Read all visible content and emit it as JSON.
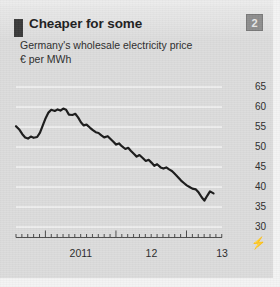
{
  "card": {
    "background_color": "#dcdcdc",
    "accent_bar_color": "#3a3a3a"
  },
  "header": {
    "title": "Cheaper for some",
    "subtitle_line1": "Germany's wholesale electricity price",
    "subtitle_line2": "€ per MWh"
  },
  "badge": {
    "label": "2",
    "color": "#8e8e8e"
  },
  "axis_break_symbol": "⚡",
  "chart_data": {
    "type": "line",
    "title": "Cheaper for some",
    "subtitle": "Germany's wholesale electricity price",
    "xlabel": "",
    "ylabel": "€ per MWh",
    "ylim": [
      30,
      65
    ],
    "yticks": [
      30,
      35,
      40,
      45,
      50,
      55,
      60,
      65
    ],
    "ytick_labels": [
      "30",
      "35",
      "40",
      "45",
      "50",
      "55",
      "60",
      "65"
    ],
    "xticks": [
      2011,
      2012,
      2013
    ],
    "xtick_labels": [
      "2011",
      "12",
      "13"
    ],
    "xlim": [
      2010.58,
      2013.5
    ],
    "grid": true,
    "grid_color": "#f5f5f5",
    "legend": false,
    "line_color": "#1a1a1a",
    "series": [
      {
        "name": "German wholesale electricity price",
        "x": [
          2010.58,
          2010.63,
          2010.67,
          2010.71,
          2010.75,
          2010.79,
          2010.83,
          2010.88,
          2010.92,
          2010.96,
          2011.0,
          2011.04,
          2011.08,
          2011.13,
          2011.17,
          2011.21,
          2011.25,
          2011.29,
          2011.33,
          2011.38,
          2011.42,
          2011.46,
          2011.5,
          2011.54,
          2011.58,
          2011.63,
          2011.67,
          2011.71,
          2011.75,
          2011.79,
          2011.83,
          2011.88,
          2011.92,
          2011.96,
          2012.0,
          2012.04,
          2012.08,
          2012.13,
          2012.17,
          2012.21,
          2012.25,
          2012.29,
          2012.33,
          2012.38,
          2012.42,
          2012.46,
          2012.5,
          2012.54,
          2012.58,
          2012.63,
          2012.67,
          2012.71,
          2012.75,
          2012.79,
          2012.83,
          2012.88,
          2012.92,
          2012.96,
          2013.0,
          2013.04,
          2013.08,
          2013.13,
          2013.17,
          2013.21,
          2013.25,
          2013.29,
          2013.33,
          2013.38
        ],
        "values": [
          55.2,
          54.3,
          53.2,
          52.4,
          52.1,
          52.6,
          52.3,
          52.5,
          53.6,
          55.4,
          57.2,
          58.6,
          59.3,
          59.0,
          59.4,
          59.1,
          59.6,
          59.3,
          58.1,
          58.0,
          58.3,
          57.4,
          56.2,
          55.4,
          55.6,
          54.8,
          54.2,
          53.7,
          53.5,
          52.9,
          52.4,
          52.7,
          52.0,
          51.3,
          50.6,
          50.9,
          50.2,
          49.5,
          49.8,
          49.0,
          48.3,
          47.6,
          48.0,
          47.2,
          46.5,
          46.8,
          46.1,
          45.3,
          45.7,
          44.9,
          44.6,
          44.9,
          44.4,
          44.0,
          43.3,
          42.4,
          41.6,
          41.0,
          40.4,
          40.0,
          39.6,
          39.4,
          38.6,
          37.5,
          36.6,
          37.8,
          38.9,
          38.4
        ]
      }
    ]
  }
}
